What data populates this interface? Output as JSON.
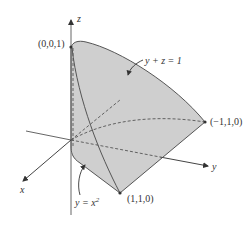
{
  "diagram": {
    "axes": {
      "x_label": "x",
      "y_label": "y",
      "z_label": "z"
    },
    "points": [
      {
        "label": "(0,0,1)"
      },
      {
        "label": "(−1,1,0)"
      },
      {
        "label": "(1,1,0)"
      }
    ],
    "annotations": {
      "plane": "y + z = 1",
      "cylinder_y": "y = x",
      "cylinder_exp": "2"
    },
    "colors": {
      "surface_fill": "#cfcfcf",
      "stroke": "#555555",
      "background": "#ffffff"
    }
  }
}
